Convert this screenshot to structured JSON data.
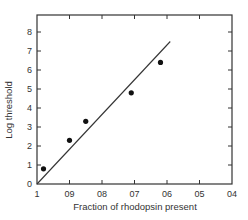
{
  "chart_data": {
    "type": "scatter",
    "title": "",
    "xlabel": "Fraction of rhodopsin present",
    "ylabel": "Log threshold",
    "xlim": [
      1.0,
      0.4
    ],
    "ylim": [
      0,
      8.9
    ],
    "x_reversed": true,
    "grid": false,
    "legend": null,
    "x_ticks": [
      1.0,
      0.9,
      0.8,
      0.7,
      0.6,
      0.5,
      0.4
    ],
    "x_tick_labels": [
      "1",
      "09",
      "08",
      "07",
      "06",
      "05",
      "04"
    ],
    "y_ticks": [
      0,
      1,
      2,
      3,
      4,
      5,
      6,
      7,
      8
    ],
    "y_tick_labels": [
      "0",
      "1",
      "2",
      "3",
      "4",
      "5",
      "6",
      "7",
      "8"
    ],
    "series": [
      {
        "name": "measured",
        "type": "scatter",
        "x": [
          0.98,
          0.9,
          0.85,
          0.71,
          0.62
        ],
        "y": [
          0.8,
          2.3,
          3.3,
          4.8,
          6.4
        ]
      },
      {
        "name": "fit line",
        "type": "line",
        "x": [
          1.0,
          0.59
        ],
        "y": [
          0.0,
          7.5
        ]
      }
    ]
  }
}
